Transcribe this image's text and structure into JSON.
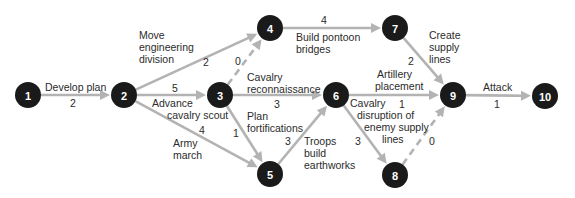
{
  "diagram": {
    "type": "activity-on-arrow network (PERT/CPM)",
    "colors": {
      "node_fill": "#1a1a1a",
      "node_text": "#ffffff",
      "edge": "#b3b3b3",
      "text": "#2b2b2b"
    },
    "nodes": [
      {
        "id": "1",
        "label": "1",
        "x": 28,
        "y": 95
      },
      {
        "id": "2",
        "label": "2",
        "x": 124,
        "y": 95
      },
      {
        "id": "3",
        "label": "3",
        "x": 220,
        "y": 95
      },
      {
        "id": "4",
        "label": "4",
        "x": 270,
        "y": 28
      },
      {
        "id": "5",
        "label": "5",
        "x": 270,
        "y": 174
      },
      {
        "id": "6",
        "label": "6",
        "x": 336,
        "y": 95
      },
      {
        "id": "7",
        "label": "7",
        "x": 395,
        "y": 28
      },
      {
        "id": "8",
        "label": "8",
        "x": 395,
        "y": 175
      },
      {
        "id": "9",
        "label": "9",
        "x": 453,
        "y": 95
      },
      {
        "id": "10",
        "label": "10",
        "x": 545,
        "y": 96
      }
    ],
    "edges": [
      {
        "from": "1",
        "to": "2",
        "activity": "Develop plan",
        "duration": "2",
        "dashed": false
      },
      {
        "from": "2",
        "to": "4",
        "activity": "Move engineering division",
        "duration": "2",
        "dashed": false
      },
      {
        "from": "2",
        "to": "3",
        "activity": "Advance cavalry scout",
        "duration": "5",
        "dashed": false
      },
      {
        "from": "2",
        "to": "5",
        "activity": "Army march",
        "duration": "4",
        "dashed": false
      },
      {
        "from": "3",
        "to": "4",
        "activity": "",
        "duration": "0",
        "dashed": true
      },
      {
        "from": "3",
        "to": "6",
        "activity": "Cavalry reconnaissance",
        "duration": "3",
        "dashed": false
      },
      {
        "from": "3",
        "to": "5",
        "activity": "Plan fortifications",
        "duration": "1",
        "dashed": false
      },
      {
        "from": "4",
        "to": "7",
        "activity": "Build pontoon bridges",
        "duration": "4",
        "dashed": false
      },
      {
        "from": "5",
        "to": "6",
        "activity": "Troops build earthworks",
        "duration": "3",
        "dashed": false
      },
      {
        "from": "6",
        "to": "9",
        "activity": "Artillery placement",
        "duration": "1",
        "dashed": false
      },
      {
        "from": "6",
        "to": "8",
        "activity": "Cavalry disruption of enemy supply lines",
        "duration": "3",
        "dashed": false
      },
      {
        "from": "7",
        "to": "9",
        "activity": "Create supply lines",
        "duration": "2",
        "dashed": false
      },
      {
        "from": "8",
        "to": "9",
        "activity": "",
        "duration": "0",
        "dashed": true
      },
      {
        "from": "9",
        "to": "10",
        "activity": "Attack",
        "duration": "1",
        "dashed": false
      }
    ],
    "activity_text_lines": {
      "e1_2": [
        "Develop plan"
      ],
      "e2_4": [
        "Move",
        "engineering",
        "division"
      ],
      "e2_3": [
        "Advance",
        "cavalry scout"
      ],
      "e2_5": [
        "Army",
        "march"
      ],
      "e3_6": [
        "Cavalry",
        "reconnaissance"
      ],
      "e3_5": [
        "Plan",
        "fortifications"
      ],
      "e4_7": [
        "Build pontoon",
        "bridges"
      ],
      "e5_6": [
        "Troops",
        "build",
        "earthworks"
      ],
      "e6_9": [
        "Artillery",
        "placement"
      ],
      "e6_8": [
        "Cavalry",
        "disruption of",
        "enemy supply",
        "lines"
      ],
      "e7_9": [
        "Create",
        "supply",
        "lines"
      ],
      "e9_10": [
        "Attack"
      ]
    }
  }
}
